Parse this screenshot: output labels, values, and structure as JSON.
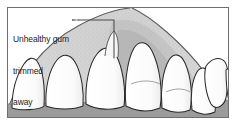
{
  "figure": {
    "kind": "dental-illustration",
    "title": "Unhealthy gum trimmed away",
    "annotation": {
      "name": "unhealthy-gum-callout",
      "lines": [
        "Unhealthy gum",
        "trimmed",
        "away"
      ],
      "line1": "Unhealthy gum",
      "line2": "trimmed",
      "line3": "away",
      "leader": "horizontal-then-down"
    },
    "colors": {
      "frame": "#6e6e6e",
      "background": "#ffffff",
      "gum": "#d9d9d9",
      "gum_shadow": "#b4b4b4",
      "gum_stipple": "#8c8c8c",
      "tooth": "#fdfdfd",
      "tooth_outline": "#2b2b2b",
      "palate": "#9a9a9a",
      "text": "#232323"
    },
    "parts": {
      "gum_label": "gum tissue",
      "teeth_label": "upper teeth",
      "palate_label": "palate shadow",
      "frame_label": "illustration frame"
    },
    "teeth_count": 8
  }
}
